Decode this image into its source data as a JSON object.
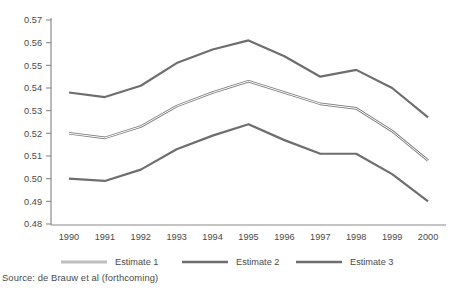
{
  "chart_data": {
    "type": "line",
    "title": "",
    "xlabel": "",
    "ylabel": "",
    "x": [
      1990,
      1991,
      1992,
      1993,
      1994,
      1995,
      1996,
      1997,
      1998,
      1999,
      2000
    ],
    "categories": [
      "1990",
      "1991",
      "1992",
      "1993",
      "1994",
      "1995",
      "1996",
      "1997",
      "1998",
      "1999",
      "2000"
    ],
    "series": [
      {
        "name": "Estimate 1",
        "color": "#9a9a9a",
        "values": [
          0.52,
          0.518,
          0.523,
          0.532,
          0.538,
          0.543,
          0.538,
          0.533,
          0.531,
          0.521,
          0.508
        ]
      },
      {
        "name": "Estimate 2",
        "color": "#6e6e6e",
        "values": [
          0.5,
          0.499,
          0.504,
          0.513,
          0.519,
          0.524,
          0.517,
          0.511,
          0.511,
          0.502,
          0.49
        ]
      },
      {
        "name": "Estimate 3",
        "color": "#6e6e6e",
        "values": [
          0.538,
          0.536,
          0.541,
          0.551,
          0.557,
          0.561,
          0.554,
          0.545,
          0.548,
          0.54,
          0.527
        ]
      }
    ],
    "ylim": [
      0.48,
      0.57
    ],
    "ytick_labels": [
      "0.57",
      "0.56",
      "0.55",
      "0.54",
      "0.53",
      "0.52",
      "0.51",
      "0.50",
      "0.49",
      "0.48"
    ],
    "ytick_values": [
      0.57,
      0.56,
      0.55,
      0.54,
      0.53,
      0.52,
      0.51,
      0.5,
      0.49,
      0.48
    ],
    "grid": false,
    "legend_position": "bottom"
  },
  "legend": {
    "items": [
      {
        "label": "Estimate 1",
        "color": "#9a9a9a"
      },
      {
        "label": "Estimate 2",
        "color": "#6e6e6e"
      },
      {
        "label": "Estimate 3",
        "color": "#6e6e6e"
      }
    ]
  },
  "footer": {
    "source": "Source: de Brauw et al (forthcoming)"
  },
  "colors": {
    "axis": "#8a8a8a",
    "text": "#4a4a4a",
    "background": "#ffffff"
  }
}
